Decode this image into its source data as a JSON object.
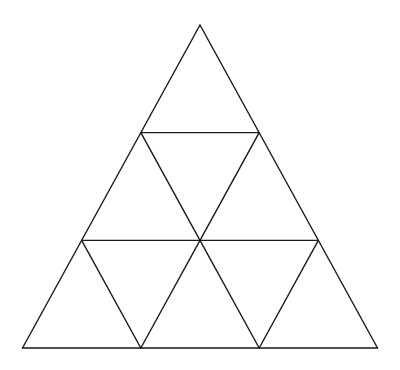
{
  "diagram": {
    "rows": 3,
    "small_triangle_count": 9,
    "stroke_color": "#1a1a1a",
    "background_color": "#ffffff",
    "grid_segments": [
      {
        "id": "outer-left",
        "from": [
          0,
          0
        ],
        "to": [
          0,
          3
        ]
      },
      {
        "id": "outer-right",
        "from": [
          0,
          0
        ],
        "to": [
          3,
          3
        ]
      },
      {
        "id": "outer-base",
        "from": [
          0,
          3
        ],
        "to": [
          3,
          3
        ]
      },
      {
        "id": "row1-horizontal",
        "from": [
          0,
          1
        ],
        "to": [
          1,
          1
        ]
      },
      {
        "id": "row2-horizontal",
        "from": [
          0,
          2
        ],
        "to": [
          2,
          2
        ]
      },
      {
        "id": "inner-down-1",
        "from": [
          0,
          1
        ],
        "to": [
          1,
          2
        ]
      },
      {
        "id": "inner-up-1",
        "from": [
          1,
          1
        ],
        "to": [
          1,
          2
        ]
      },
      {
        "id": "inner-down-2",
        "from": [
          0,
          2
        ],
        "to": [
          1,
          3
        ]
      },
      {
        "id": "inner-up-2",
        "from": [
          1,
          2
        ],
        "to": [
          1,
          3
        ]
      },
      {
        "id": "inner-down-3",
        "from": [
          1,
          2
        ],
        "to": [
          2,
          3
        ]
      },
      {
        "id": "inner-up-3",
        "from": [
          2,
          2
        ],
        "to": [
          2,
          3
        ]
      }
    ]
  }
}
